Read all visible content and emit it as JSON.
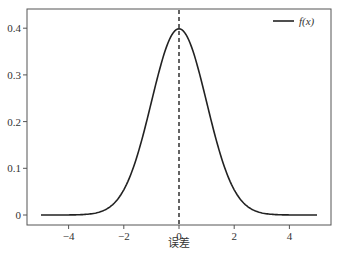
{
  "chart_data": {
    "type": "line",
    "title": "",
    "xlabel": "误差",
    "ylabel": "",
    "xlim": [
      -5.5,
      5.5
    ],
    "ylim": [
      -0.025,
      0.44
    ],
    "xticks": [
      -4,
      -2,
      0,
      2,
      4
    ],
    "xtick_labels": [
      "−4",
      "−2",
      "0",
      "2",
      "4"
    ],
    "yticks": [
      0,
      0.1,
      0.2,
      0.3,
      0.4
    ],
    "ytick_labels": [
      "0",
      "0.1",
      "0.2",
      "0.3",
      "0.4"
    ],
    "grid": false,
    "legend_position": "upper right",
    "series": [
      {
        "name": "f(x)",
        "function": "standard normal pdf",
        "color": "#222222",
        "x": [
          -5,
          -4,
          -3,
          -2.5,
          -2,
          -1.5,
          -1,
          -0.5,
          0,
          0.5,
          1,
          1.5,
          2,
          2.5,
          3,
          4,
          5
        ],
        "y": [
          0.0,
          0.0001,
          0.0044,
          0.0175,
          0.054,
          0.1295,
          0.242,
          0.3521,
          0.3989,
          0.3521,
          0.242,
          0.1295,
          0.054,
          0.0175,
          0.0044,
          0.0001,
          0.0
        ]
      }
    ],
    "annotations": [
      {
        "type": "vertical_dashed_line",
        "x": 0,
        "color": "#222222"
      }
    ]
  },
  "legend": {
    "label": "f(x)"
  }
}
